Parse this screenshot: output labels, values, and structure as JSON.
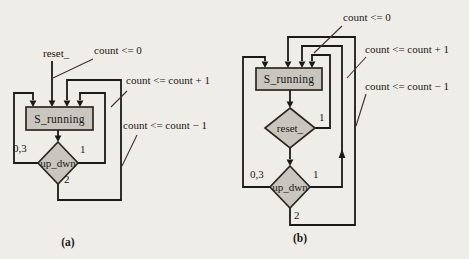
{
  "figure": {
    "type": "asm-state-diagram",
    "colors": {
      "background": "#efede8",
      "line": "#1c1a16",
      "shape_fill": "#c9c5bf",
      "shape_stroke": "#2b2822",
      "text": "#1b1813"
    },
    "panel_a": {
      "caption": "(a)",
      "state": "S_running",
      "reset_input": "reset_",
      "decision": "up_dwn",
      "branches": {
        "hold": "0,3",
        "up": "1",
        "down": "2"
      },
      "annotations": {
        "reset": "count <= 0",
        "increment": "count <= count + 1",
        "decrement": "count <= count − 1"
      }
    },
    "panel_b": {
      "caption": "(b)",
      "state": "S_running",
      "decision_reset": "reset_",
      "reset_branch": "1",
      "decision": "up_dwn",
      "branches": {
        "hold": "0,3",
        "up": "1",
        "down": "2"
      },
      "annotations": {
        "reset": "count <= 0",
        "increment": "count <= count + 1",
        "decrement": "count <= count − 1"
      }
    }
  }
}
